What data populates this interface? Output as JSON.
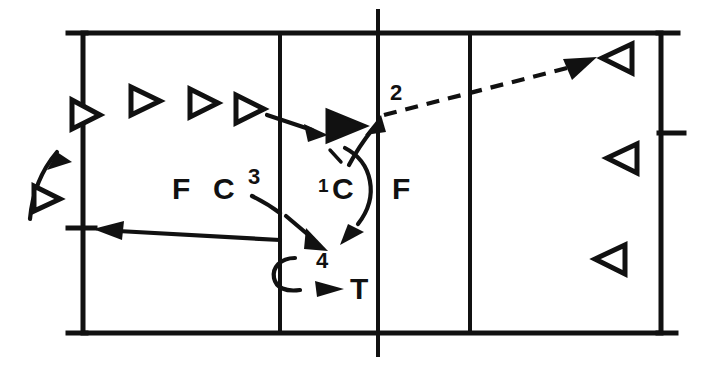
{
  "diagram": {
    "stroke_color": "#111111",
    "background_color": "#ffffff",
    "court": {
      "left": 83,
      "top": 33,
      "right": 661,
      "bottom": 333,
      "attack_line_left_x": 280,
      "center_line_x": 378,
      "attack_line_right_x": 470,
      "center_line_overhang": 22,
      "baseline_overhang": 15,
      "side_tick_y": 228,
      "right_tick_y": 133
    },
    "labels": [
      {
        "id": "label-F-left",
        "text": "F",
        "x": 172,
        "y": 199,
        "size": "normal"
      },
      {
        "id": "label-C-left",
        "text": "C",
        "x": 213,
        "y": 199,
        "size": "normal"
      },
      {
        "id": "label-3",
        "text": "3",
        "x": 248,
        "y": 184,
        "size": "num"
      },
      {
        "id": "label-1",
        "text": "1",
        "x": 318,
        "y": 187,
        "size": "small"
      },
      {
        "id": "label-C-mid",
        "text": "C",
        "x": 336,
        "y": 196,
        "size": "normal"
      },
      {
        "id": "label-F-right",
        "text": "F",
        "x": 392,
        "y": 196,
        "size": "normal"
      },
      {
        "id": "label-2",
        "text": "2",
        "x": 390,
        "y": 100,
        "size": "num"
      },
      {
        "id": "label-4",
        "text": "4",
        "x": 316,
        "y": 267,
        "size": "num"
      },
      {
        "id": "label-T",
        "text": "T",
        "x": 354,
        "y": 296,
        "size": "normal"
      }
    ],
    "players": [
      {
        "id": "player-receiver-outside-left",
        "kind": "open-right",
        "cx": 46,
        "cy": 198,
        "size": 14
      },
      {
        "id": "player-on-sideline-left",
        "kind": "open-right",
        "cx": 85,
        "cy": 114,
        "size": 16
      },
      {
        "id": "player-back-row-1",
        "kind": "open-right",
        "cx": 144,
        "cy": 100,
        "size": 16
      },
      {
        "id": "player-back-row-2",
        "kind": "open-right",
        "cx": 203,
        "cy": 102,
        "size": 16
      },
      {
        "id": "player-back-row-3",
        "kind": "open-right",
        "cx": 249,
        "cy": 108,
        "size": 16
      },
      {
        "id": "player-attacker-filled",
        "kind": "filled-right",
        "cx": 345,
        "cy": 124,
        "size": 17
      },
      {
        "id": "player-opponent-1",
        "kind": "open-left",
        "cx": 617,
        "cy": 58,
        "size": 16
      },
      {
        "id": "player-opponent-2",
        "kind": "open-left",
        "cx": 622,
        "cy": 158,
        "size": 16
      },
      {
        "id": "player-opponent-3",
        "kind": "open-left",
        "cx": 610,
        "cy": 259,
        "size": 16
      }
    ],
    "movements": [
      {
        "id": "arrow-entry-curve",
        "style": "solid",
        "description": "curved arrow entering court from lower left toward sideline player"
      },
      {
        "id": "arrow-pass-to-attacker",
        "style": "solid",
        "description": "short arrow from back-row player to filled attacker"
      },
      {
        "id": "arrow-set-path-1",
        "style": "solid",
        "description": "curve labeled 1 from attacker down around C"
      },
      {
        "id": "arrow-spike-path-2",
        "style": "dashed",
        "description": "long dashed arrow labeled 2 across net to opponent court"
      },
      {
        "id": "arrow-path-3",
        "style": "solid",
        "description": "dashed-curve arrow labeled 3 moving down-right toward 4"
      },
      {
        "id": "arrow-path-4-to-T",
        "style": "solid",
        "description": "small curved arrow at 4 pointing right to T"
      },
      {
        "id": "arrow-long-left",
        "style": "solid",
        "description": "long straight arrow pointing left to sideline tick"
      }
    ]
  }
}
